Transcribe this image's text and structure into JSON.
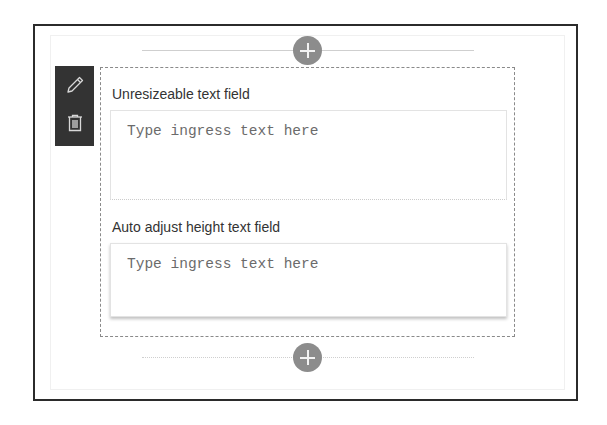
{
  "canvas": {
    "add_section_top": {
      "icon": "plus-icon",
      "label": "+"
    },
    "add_section_bottom": {
      "icon": "plus-icon",
      "label": "+"
    }
  },
  "toolbar": {
    "items": [
      {
        "name": "edit",
        "icon": "pencil-icon"
      },
      {
        "name": "delete",
        "icon": "trash-icon"
      }
    ]
  },
  "webpart": {
    "fields": [
      {
        "label": "Unresizeable text field",
        "placeholder": "Type ingress text here",
        "value": ""
      },
      {
        "label": "Auto adjust height text field",
        "placeholder": "Type ingress text here",
        "value": ""
      }
    ]
  },
  "colors": {
    "toolbar_bg": "#333333",
    "add_button": "#8c8c8c",
    "label_text": "#333333",
    "placeholder_text": "#6b6b6b",
    "frame_border": "#2b2b2b"
  }
}
